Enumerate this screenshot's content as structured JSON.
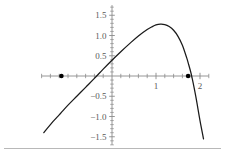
{
  "figure": {
    "kind": "cartesian-plot",
    "background_color": "#ffffff",
    "curve_color": "#1a1a1a",
    "axis_color": "#8a8a8a",
    "label_color": "#5a5a5a",
    "point_color": "#000000",
    "footer_rule_color": "#b8b8b8"
  },
  "chart_data": {
    "type": "line",
    "title": "",
    "subtitle": "",
    "xlabel": "",
    "ylabel": "",
    "xlim": [
      -1.6,
      2.2
    ],
    "ylim": [
      -1.7,
      1.75
    ],
    "grid": false,
    "legend": null,
    "axes": {
      "x_axis_at_y": 0,
      "y_axis_at_x": 0,
      "x_major_ticks": [
        1,
        2
      ],
      "x_major_tick_labels": [
        "1",
        "2"
      ],
      "x_minor_tick_step": 0.2,
      "y_major_ticks": [
        1.5,
        1.0,
        0.5,
        -0.5,
        -1.0,
        -1.5
      ],
      "y_major_tick_labels": [
        "1.5",
        "1.0",
        "0.5",
        "-0.5",
        "-1.0",
        "-1.5"
      ],
      "y_minor_tick_step": 0.1
    },
    "series": [
      {
        "name": "curve",
        "kind": "smooth-curve",
        "x": [
          -1.55,
          -1.4,
          -1.2,
          -1.15,
          -1.0,
          -0.8,
          -0.6,
          -0.4,
          -0.2,
          0.0,
          0.2,
          0.4,
          0.6,
          0.8,
          0.9,
          1.0,
          1.1,
          1.2,
          1.3,
          1.4,
          1.5,
          1.6,
          1.7,
          1.73,
          1.8,
          1.9,
          2.0,
          2.08
        ],
        "y": [
          -1.4,
          -1.2,
          -0.96,
          -0.9,
          -0.72,
          -0.5,
          -0.28,
          -0.06,
          0.17,
          0.39,
          0.6,
          0.8,
          0.99,
          1.15,
          1.21,
          1.26,
          1.28,
          1.27,
          1.22,
          1.13,
          0.98,
          0.76,
          0.44,
          0.33,
          0.05,
          -0.48,
          -1.1,
          -1.55
        ]
      }
    ],
    "marked_points": [
      {
        "label": "left-root",
        "x": -1.15,
        "y": 0
      },
      {
        "label": "right-root",
        "x": 1.73,
        "y": 0
      }
    ],
    "annotations": []
  },
  "footer": {
    "rule_present": true
  }
}
